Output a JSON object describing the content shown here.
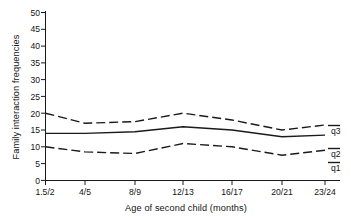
{
  "chart_data": {
    "type": "line",
    "title": "",
    "xlabel": "Age of second child (months)",
    "ylabel": "Family interaction frequencies",
    "categories": [
      "1.5/2",
      "4/5",
      "8/9",
      "12/13",
      "16/17",
      "20/21",
      "23/24"
    ],
    "x_values": [
      0,
      1,
      2,
      3,
      4,
      5,
      6
    ],
    "ylim": [
      0,
      50
    ],
    "y_ticks": [
      0,
      5,
      10,
      15,
      20,
      25,
      30,
      35,
      40,
      45,
      50
    ],
    "grid": false,
    "legend_position": "right-inline",
    "series": [
      {
        "name": "q3",
        "label": "q3",
        "style": "dashed",
        "color": "#1a1a1a",
        "values": [
          20,
          17,
          17.5,
          20,
          18,
          15,
          16.5
        ]
      },
      {
        "name": "q2",
        "label": "q2",
        "style": "solid",
        "color": "#1a1a1a",
        "values": [
          14,
          14,
          14.5,
          16,
          15,
          13,
          13.5
        ]
      },
      {
        "name": "q1",
        "label": "q1",
        "style": "dashed",
        "color": "#1a1a1a",
        "values": [
          10,
          8.5,
          8,
          11,
          10,
          7.5,
          9
        ]
      }
    ]
  },
  "axis": {
    "y_tick_labels": [
      "50",
      "45",
      "40",
      "35",
      "30",
      "25",
      "20",
      "15",
      "10",
      "5",
      "0"
    ],
    "x_tick_labels": [
      "1.5/2",
      "4/5",
      "8/9",
      "12/13",
      "16/17",
      "20/21",
      "23/24"
    ],
    "x_title": "Age of second child (months)",
    "y_title": "Family interaction frequencies"
  },
  "legend": {
    "q3": "q3",
    "q2": "q2",
    "q1": "q1"
  }
}
